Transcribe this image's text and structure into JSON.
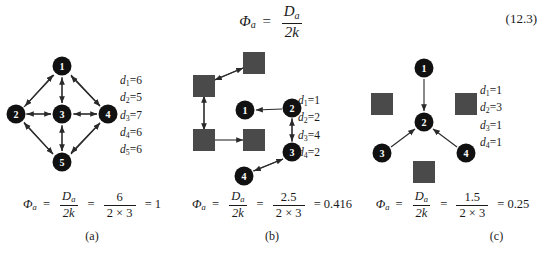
{
  "figure": {
    "equation_number": "(12.3)",
    "main_equation": {
      "lhs": "Φ",
      "lhs_sub": "a",
      "equals": "=",
      "numerator": "D",
      "numerator_sub": "a",
      "denominator": "2k"
    }
  },
  "panels": [
    {
      "id": "a",
      "caption": "(a)",
      "degrees": [
        {
          "symbol": "d",
          "index": "1",
          "value": "6"
        },
        {
          "symbol": "d",
          "index": "2",
          "value": "5"
        },
        {
          "symbol": "d",
          "index": "3",
          "value": "7"
        },
        {
          "symbol": "d",
          "index": "4",
          "value": "6"
        },
        {
          "symbol": "d",
          "index": "5",
          "value": "6"
        }
      ],
      "formula": {
        "lhs": "Φ",
        "lhs_sub": "a",
        "numerator": "D",
        "numerator_sub": "a",
        "denominator": "2k",
        "value_numerator": "6",
        "value_denominator": "2 × 3",
        "result": "1"
      },
      "nodes": [
        {
          "label": "1",
          "shape": "circle",
          "cx": 60,
          "cy": 18
        },
        {
          "label": "2",
          "shape": "circle",
          "cx": 14,
          "cy": 66
        },
        {
          "label": "3",
          "shape": "circle",
          "cx": 60,
          "cy": 66
        },
        {
          "label": "4",
          "shape": "circle",
          "cx": 106,
          "cy": 66
        },
        {
          "label": "5",
          "shape": "circle",
          "cx": 60,
          "cy": 114
        }
      ]
    },
    {
      "id": "b",
      "caption": "(b)",
      "degrees": [
        {
          "symbol": "d",
          "index": "1",
          "value": "1"
        },
        {
          "symbol": "d",
          "index": "2",
          "value": "2"
        },
        {
          "symbol": "d",
          "index": "3",
          "value": "4"
        },
        {
          "symbol": "d",
          "index": "4",
          "value": "2"
        }
      ],
      "formula": {
        "lhs": "Φ",
        "lhs_sub": "a",
        "numerator": "D",
        "numerator_sub": "a",
        "denominator": "2k",
        "value_numerator": "2.5",
        "value_denominator": "2 × 3",
        "result": "0.416"
      },
      "nodes": [
        {
          "label": "1",
          "shape": "circle",
          "cx": 63,
          "cy": 62
        },
        {
          "label": "2",
          "shape": "circle",
          "cx": 110,
          "cy": 60
        },
        {
          "label": "3",
          "shape": "circle",
          "cx": 110,
          "cy": 104
        },
        {
          "label": "4",
          "shape": "circle",
          "cx": 62,
          "cy": 128
        },
        {
          "label": "",
          "shape": "square",
          "cx": 72,
          "cy": 15
        },
        {
          "label": "",
          "shape": "square",
          "cx": 22,
          "cy": 38
        },
        {
          "label": "",
          "shape": "square",
          "cx": 22,
          "cy": 92
        },
        {
          "label": "",
          "shape": "square",
          "cx": 72,
          "cy": 92
        }
      ]
    },
    {
      "id": "c",
      "caption": "(c)",
      "degrees": [
        {
          "symbol": "d",
          "index": "1",
          "value": "1"
        },
        {
          "symbol": "d",
          "index": "2",
          "value": "3"
        },
        {
          "symbol": "d",
          "index": "3",
          "value": "1"
        },
        {
          "symbol": "d",
          "index": "4",
          "value": "1"
        }
      ],
      "formula": {
        "lhs": "Φ",
        "lhs_sub": "a",
        "numerator": "D",
        "numerator_sub": "a",
        "denominator": "2k",
        "value_numerator": "1.5",
        "value_denominator": "2 × 3",
        "result": "0.25"
      },
      "nodes": [
        {
          "label": "1",
          "shape": "circle",
          "cx": 62,
          "cy": 20
        },
        {
          "label": "2",
          "shape": "circle",
          "cx": 62,
          "cy": 74
        },
        {
          "label": "3",
          "shape": "circle",
          "cx": 20,
          "cy": 105
        },
        {
          "label": "4",
          "shape": "circle",
          "cx": 104,
          "cy": 105
        },
        {
          "label": "",
          "shape": "square",
          "cx": 20,
          "cy": 56
        },
        {
          "label": "",
          "shape": "square",
          "cx": 104,
          "cy": 56
        },
        {
          "label": "",
          "shape": "square",
          "cx": 62,
          "cy": 124
        }
      ]
    }
  ],
  "colors": {
    "node_fill": "#111111",
    "square_fill": "#4a4a4a",
    "edge": "#2a2a2a",
    "text": "#1a1a1a",
    "background": "#ffffff"
  }
}
